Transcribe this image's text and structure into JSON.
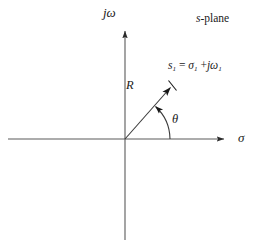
{
  "figure": {
    "domain": "diagram",
    "title_annotation": "s-plane",
    "background_color": "#ffffff",
    "line_color": "#4a4a4a",
    "text_color": "#1a1a1a",
    "width": 260,
    "height": 252
  },
  "axes": {
    "vertical": {
      "label_text": "jω",
      "label_j": "j",
      "label_omega": "ω",
      "arrow": "up"
    },
    "horizontal": {
      "label_text": "σ",
      "arrow": "right"
    },
    "origin": {
      "x": 125,
      "y": 139
    }
  },
  "annotations": {
    "plane_label": "s-plane",
    "plane_label_italic": "s",
    "plane_label_rest": "-plane",
    "point": {
      "symbol": "s",
      "symbol_sub": "1",
      "equals": "=",
      "real_part": "σ",
      "real_sub": "1",
      "plus": "+",
      "imag_j": "j",
      "imag_part": "ω",
      "imag_sub": "1",
      "full_text": "s₁ = σ₁ + jω₁"
    },
    "magnitude_label": "R",
    "angle_label": "θ"
  },
  "vector": {
    "from_x": 125,
    "from_y": 139,
    "to_x": 172,
    "to_y": 86,
    "has_arrowhead": true,
    "has_endpoint_tick": true
  },
  "angle_arc": {
    "center_x": 125,
    "center_y": 139,
    "radius": 45,
    "start_angle_deg": 0,
    "end_angle_deg": 48,
    "has_arrowhead": true
  }
}
